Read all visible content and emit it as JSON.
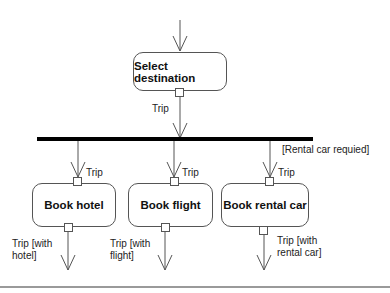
{
  "diagram": {
    "type": "uml-activity",
    "nodes": {
      "select": {
        "label": "Select destination"
      },
      "hotel": {
        "label": "Book hotel"
      },
      "flight": {
        "label": "Book flight"
      },
      "car": {
        "label": "Book rental car"
      }
    },
    "labels": {
      "select_out": "Trip",
      "hotel_in": "Trip",
      "flight_in": "Trip",
      "car_in": "Trip",
      "guard_car": "[Rental car requied]",
      "hotel_out_1": "Trip [with",
      "hotel_out_2": "hotel]",
      "flight_out_1": "Trip [with",
      "flight_out_2": "flight]",
      "car_out_1": "Trip [with",
      "car_out_2": "rental car]"
    },
    "fork_bar": {
      "color": "#000000"
    },
    "colors": {
      "line": "#555555",
      "rule": "#9a9a9a"
    }
  }
}
